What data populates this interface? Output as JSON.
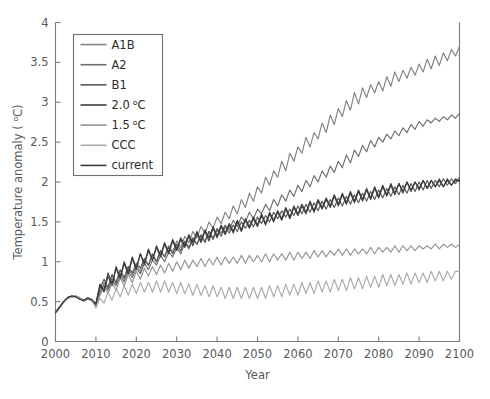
{
  "figure": {
    "background": "#ffffff",
    "axis_color": "#7a7c7f",
    "text_color": "#58595b"
  },
  "axes": {
    "x_title": "Year",
    "y_title_prefix": "Temperature anomaly ( ",
    "y_title_sup": "o",
    "y_title_suffix": "C)",
    "x_ticks": [
      "2000",
      "2010",
      "2020",
      "2030",
      "2040",
      "2050",
      "2060",
      "2070",
      "2080",
      "2090",
      "2100"
    ],
    "y_ticks": [
      "0",
      "0.5",
      "1",
      "1.5",
      "2",
      "2.5",
      "3",
      "3.5",
      "4"
    ]
  },
  "legend": {
    "position": "upper-left",
    "entries": [
      {
        "label": "A1B",
        "color": "#808285"
      },
      {
        "label": "A2",
        "color": "#6d6e71"
      },
      {
        "label": "B1",
        "color": "#58595b"
      },
      {
        "label": "2.0",
        "unit_sup": "o",
        "unit": "C",
        "color": "#414042"
      },
      {
        "label": "1.5",
        "unit_sup": "o",
        "unit": "C",
        "color": "#929497"
      },
      {
        "label": "CCC",
        "color": "#a7a9ac"
      },
      {
        "label": "current",
        "color": "#3b3b3d"
      }
    ]
  },
  "chart_data": {
    "type": "line",
    "title": "",
    "xlabel": "Year",
    "ylabel": "Temperature anomaly (oC)",
    "xlim": [
      2000,
      2100
    ],
    "ylim": [
      0,
      4
    ],
    "grid": false,
    "legend_position": "upper-left",
    "x": [
      2000,
      2001,
      2002,
      2003,
      2004,
      2005,
      2006,
      2007,
      2008,
      2009,
      2010,
      2011,
      2012,
      2013,
      2014,
      2015,
      2016,
      2017,
      2018,
      2019,
      2020,
      2021,
      2022,
      2023,
      2024,
      2025,
      2026,
      2027,
      2028,
      2029,
      2030,
      2031,
      2032,
      2033,
      2034,
      2035,
      2036,
      2037,
      2038,
      2039,
      2040,
      2041,
      2042,
      2043,
      2044,
      2045,
      2046,
      2047,
      2048,
      2049,
      2050,
      2051,
      2052,
      2053,
      2054,
      2055,
      2056,
      2057,
      2058,
      2059,
      2060,
      2061,
      2062,
      2063,
      2064,
      2065,
      2066,
      2067,
      2068,
      2069,
      2070,
      2071,
      2072,
      2073,
      2074,
      2075,
      2076,
      2077,
      2078,
      2079,
      2080,
      2081,
      2082,
      2083,
      2084,
      2085,
      2086,
      2087,
      2088,
      2089,
      2090,
      2091,
      2092,
      2093,
      2094,
      2095,
      2096,
      2097,
      2098,
      2099,
      2100
    ],
    "series": [
      {
        "name": "A1B",
        "color": "#808285",
        "values": [
          0.36,
          0.42,
          0.5,
          0.55,
          0.56,
          0.57,
          0.55,
          0.52,
          0.55,
          0.53,
          0.44,
          0.6,
          0.74,
          0.66,
          0.8,
          0.72,
          0.86,
          0.78,
          0.92,
          0.83,
          0.96,
          0.88,
          1.02,
          0.95,
          1.08,
          1.0,
          1.14,
          1.06,
          1.2,
          1.12,
          1.26,
          1.18,
          1.32,
          1.24,
          1.38,
          1.3,
          1.44,
          1.36,
          1.5,
          1.42,
          1.56,
          1.48,
          1.62,
          1.54,
          1.7,
          1.6,
          1.78,
          1.68,
          1.86,
          1.76,
          1.94,
          1.86,
          2.06,
          1.96,
          2.14,
          2.06,
          2.26,
          2.14,
          2.36,
          2.26,
          2.44,
          2.36,
          2.56,
          2.44,
          2.62,
          2.54,
          2.74,
          2.62,
          2.84,
          2.72,
          2.92,
          2.82,
          3.02,
          2.9,
          3.12,
          2.98,
          3.18,
          3.06,
          3.22,
          3.12,
          3.26,
          3.14,
          3.32,
          3.2,
          3.38,
          3.26,
          3.4,
          3.3,
          3.44,
          3.34,
          3.48,
          3.38,
          3.54,
          3.42,
          3.58,
          3.46,
          3.62,
          3.52,
          3.66,
          3.58,
          3.7
        ]
      },
      {
        "name": "A2",
        "color": "#6d6e71",
        "values": [
          0.36,
          0.43,
          0.5,
          0.55,
          0.57,
          0.56,
          0.54,
          0.51,
          0.54,
          0.52,
          0.46,
          0.62,
          0.7,
          0.64,
          0.76,
          0.7,
          0.82,
          0.75,
          0.88,
          0.8,
          0.92,
          0.85,
          0.98,
          0.9,
          1.02,
          0.96,
          1.08,
          1.0,
          1.12,
          1.06,
          1.18,
          1.1,
          1.24,
          1.16,
          1.28,
          1.22,
          1.32,
          1.26,
          1.38,
          1.3,
          1.42,
          1.36,
          1.46,
          1.4,
          1.52,
          1.44,
          1.56,
          1.5,
          1.62,
          1.54,
          1.66,
          1.6,
          1.72,
          1.64,
          1.78,
          1.7,
          1.84,
          1.76,
          1.9,
          1.82,
          1.96,
          1.88,
          2.02,
          1.94,
          2.08,
          2.0,
          2.14,
          2.06,
          2.2,
          2.12,
          2.26,
          2.18,
          2.34,
          2.24,
          2.4,
          2.32,
          2.46,
          2.38,
          2.52,
          2.44,
          2.56,
          2.5,
          2.6,
          2.54,
          2.64,
          2.58,
          2.68,
          2.62,
          2.72,
          2.66,
          2.76,
          2.7,
          2.78,
          2.74,
          2.8,
          2.76,
          2.82,
          2.78,
          2.84,
          2.8,
          2.86
        ]
      },
      {
        "name": "B1",
        "color": "#58595b",
        "values": [
          0.36,
          0.42,
          0.49,
          0.54,
          0.56,
          0.57,
          0.54,
          0.52,
          0.55,
          0.52,
          0.45,
          0.66,
          0.78,
          0.68,
          0.84,
          0.74,
          0.9,
          0.8,
          0.94,
          0.86,
          0.98,
          0.92,
          1.04,
          0.96,
          1.1,
          1.0,
          1.14,
          1.06,
          1.18,
          1.1,
          1.22,
          1.14,
          1.26,
          1.18,
          1.3,
          1.22,
          1.34,
          1.24,
          1.38,
          1.28,
          1.4,
          1.32,
          1.44,
          1.36,
          1.46,
          1.38,
          1.5,
          1.42,
          1.52,
          1.44,
          1.56,
          1.48,
          1.58,
          1.5,
          1.62,
          1.54,
          1.64,
          1.56,
          1.66,
          1.58,
          1.7,
          1.6,
          1.72,
          1.62,
          1.74,
          1.64,
          1.76,
          1.66,
          1.78,
          1.68,
          1.8,
          1.7,
          1.82,
          1.72,
          1.84,
          1.74,
          1.86,
          1.76,
          1.88,
          1.78,
          1.9,
          1.8,
          1.92,
          1.82,
          1.94,
          1.84,
          1.96,
          1.86,
          1.98,
          1.88,
          2.0,
          1.9,
          2.02,
          1.92,
          2.02,
          1.94,
          2.04,
          1.96,
          2.04,
          1.98,
          2.06
        ]
      },
      {
        "name": "2.0 oC",
        "color": "#414042",
        "values": [
          0.37,
          0.43,
          0.5,
          0.55,
          0.57,
          0.56,
          0.53,
          0.51,
          0.54,
          0.51,
          0.48,
          0.7,
          0.62,
          0.82,
          0.7,
          0.92,
          0.78,
          0.98,
          0.84,
          1.04,
          0.9,
          1.1,
          0.96,
          1.14,
          1.02,
          1.18,
          1.06,
          1.22,
          1.1,
          1.26,
          1.14,
          1.28,
          1.18,
          1.32,
          1.2,
          1.36,
          1.24,
          1.38,
          1.26,
          1.42,
          1.3,
          1.44,
          1.34,
          1.46,
          1.36,
          1.5,
          1.38,
          1.52,
          1.42,
          1.54,
          1.44,
          1.58,
          1.46,
          1.6,
          1.5,
          1.62,
          1.52,
          1.66,
          1.54,
          1.68,
          1.58,
          1.7,
          1.6,
          1.74,
          1.62,
          1.76,
          1.66,
          1.78,
          1.68,
          1.82,
          1.7,
          1.84,
          1.72,
          1.86,
          1.74,
          1.88,
          1.76,
          1.9,
          1.78,
          1.92,
          1.8,
          1.94,
          1.82,
          1.96,
          1.84,
          1.98,
          1.86,
          2.0,
          1.88,
          2.0,
          1.9,
          2.02,
          1.92,
          2.02,
          1.94,
          2.04,
          1.94,
          2.04,
          1.96,
          2.04,
          2.0
        ]
      },
      {
        "name": "1.5 oC",
        "color": "#929497",
        "values": [
          0.36,
          0.42,
          0.49,
          0.54,
          0.56,
          0.57,
          0.54,
          0.51,
          0.54,
          0.52,
          0.44,
          0.58,
          0.68,
          0.6,
          0.74,
          0.64,
          0.8,
          0.7,
          0.84,
          0.74,
          0.88,
          0.78,
          0.92,
          0.82,
          0.94,
          0.84,
          0.96,
          0.86,
          0.98,
          0.88,
          1.0,
          0.9,
          1.02,
          0.92,
          1.02,
          0.94,
          1.04,
          0.94,
          1.04,
          0.96,
          1.06,
          0.96,
          1.06,
          0.98,
          1.06,
          0.98,
          1.08,
          0.98,
          1.08,
          1.0,
          1.08,
          1.0,
          1.1,
          1.0,
          1.1,
          1.02,
          1.1,
          1.02,
          1.12,
          1.02,
          1.12,
          1.04,
          1.12,
          1.04,
          1.14,
          1.06,
          1.14,
          1.06,
          1.14,
          1.08,
          1.16,
          1.08,
          1.16,
          1.08,
          1.16,
          1.1,
          1.16,
          1.1,
          1.18,
          1.1,
          1.18,
          1.12,
          1.18,
          1.12,
          1.2,
          1.12,
          1.2,
          1.14,
          1.2,
          1.14,
          1.2,
          1.16,
          1.2,
          1.16,
          1.22,
          1.16,
          1.22,
          1.18,
          1.22,
          1.18,
          1.22
        ]
      },
      {
        "name": "CCC",
        "color": "#a7a9ac",
        "values": [
          0.36,
          0.42,
          0.49,
          0.54,
          0.56,
          0.57,
          0.54,
          0.51,
          0.53,
          0.51,
          0.42,
          0.54,
          0.48,
          0.62,
          0.52,
          0.66,
          0.56,
          0.7,
          0.58,
          0.72,
          0.6,
          0.74,
          0.62,
          0.74,
          0.62,
          0.76,
          0.62,
          0.76,
          0.62,
          0.74,
          0.6,
          0.74,
          0.6,
          0.72,
          0.58,
          0.72,
          0.58,
          0.7,
          0.56,
          0.7,
          0.56,
          0.68,
          0.54,
          0.68,
          0.54,
          0.68,
          0.54,
          0.68,
          0.54,
          0.68,
          0.54,
          0.68,
          0.54,
          0.7,
          0.56,
          0.7,
          0.56,
          0.72,
          0.58,
          0.72,
          0.58,
          0.74,
          0.6,
          0.74,
          0.6,
          0.76,
          0.62,
          0.76,
          0.62,
          0.78,
          0.64,
          0.78,
          0.64,
          0.8,
          0.66,
          0.8,
          0.66,
          0.82,
          0.68,
          0.82,
          0.68,
          0.84,
          0.7,
          0.84,
          0.7,
          0.84,
          0.72,
          0.86,
          0.72,
          0.86,
          0.74,
          0.86,
          0.74,
          0.88,
          0.76,
          0.88,
          0.76,
          0.88,
          0.78,
          0.88,
          0.88
        ]
      },
      {
        "name": "current",
        "color": "#3b3b3d",
        "values": [
          0.36,
          0.43,
          0.5,
          0.55,
          0.57,
          0.56,
          0.53,
          0.51,
          0.54,
          0.52,
          0.47,
          0.72,
          0.64,
          0.86,
          0.72,
          0.94,
          0.8,
          1.0,
          0.86,
          1.06,
          0.92,
          1.1,
          0.98,
          1.16,
          1.02,
          1.2,
          1.08,
          1.24,
          1.12,
          1.28,
          1.16,
          1.3,
          1.2,
          1.34,
          1.24,
          1.38,
          1.26,
          1.4,
          1.3,
          1.44,
          1.32,
          1.46,
          1.36,
          1.48,
          1.38,
          1.52,
          1.4,
          1.54,
          1.44,
          1.56,
          1.46,
          1.6,
          1.48,
          1.62,
          1.52,
          1.64,
          1.54,
          1.68,
          1.56,
          1.7,
          1.6,
          1.72,
          1.62,
          1.76,
          1.64,
          1.78,
          1.68,
          1.8,
          1.7,
          1.84,
          1.72,
          1.86,
          1.74,
          1.88,
          1.76,
          1.9,
          1.78,
          1.92,
          1.8,
          1.94,
          1.82,
          1.96,
          1.84,
          1.98,
          1.86,
          1.98,
          1.88,
          2.0,
          1.9,
          2.0,
          1.92,
          2.02,
          1.92,
          2.02,
          1.94,
          2.02,
          1.94,
          2.02,
          1.96,
          2.02,
          2.02
        ]
      }
    ]
  }
}
